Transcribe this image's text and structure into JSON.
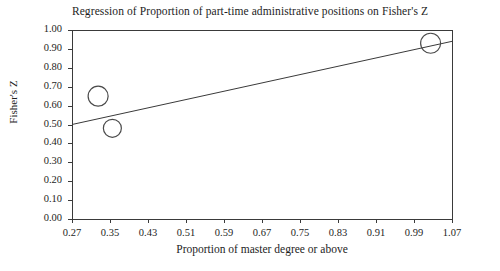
{
  "chart_data": {
    "type": "scatter",
    "title": "Regression of Proportion of part-time administrative positions on Fisher's Z",
    "xlabel": "Proportion of master degree or above",
    "ylabel": "Fisher's Z",
    "xlim": [
      0.27,
      1.07
    ],
    "ylim": [
      0.0,
      1.0
    ],
    "grid": false,
    "legend": "none",
    "marker": "open-circle",
    "xticks": [
      "0.27",
      "0.35",
      "0.43",
      "0.51",
      "0.59",
      "0.67",
      "0.75",
      "0.83",
      "0.91",
      "0.99",
      "1.07"
    ],
    "yticks": [
      "0.00",
      "0.10",
      "0.20",
      "0.30",
      "0.40",
      "0.50",
      "0.60",
      "0.70",
      "0.80",
      "0.90",
      "1.00"
    ],
    "points": [
      {
        "x": 0.325,
        "y": 0.65,
        "size": 10
      },
      {
        "x": 0.355,
        "y": 0.48,
        "size": 9
      },
      {
        "x": 1.025,
        "y": 0.93,
        "size": 10
      }
    ],
    "regression_line": {
      "x_start": 0.27,
      "y_start": 0.5,
      "x_end": 1.07,
      "y_end": 0.94
    },
    "colors": {
      "axis": "#3a3a3a",
      "marker_stroke": "#4a4a4a",
      "line": "#3a3a3a",
      "background": "#ffffff"
    }
  }
}
